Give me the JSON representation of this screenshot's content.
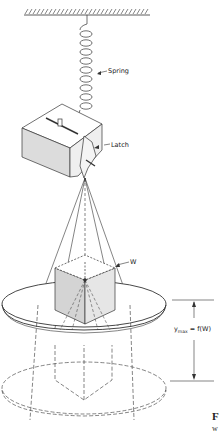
{
  "figure": {
    "labels": {
      "spring": "Spring",
      "latch": "Latch",
      "weight": "W",
      "ymax_formula": "y",
      "ymax_sub": "max",
      "ymax_rhs": " = f(W)"
    },
    "caption": {
      "prefix_bold": "F",
      "second_line": "w"
    },
    "colors": {
      "line": "#333333",
      "shade": "#d9d9d9",
      "background": "#ffffff"
    }
  }
}
